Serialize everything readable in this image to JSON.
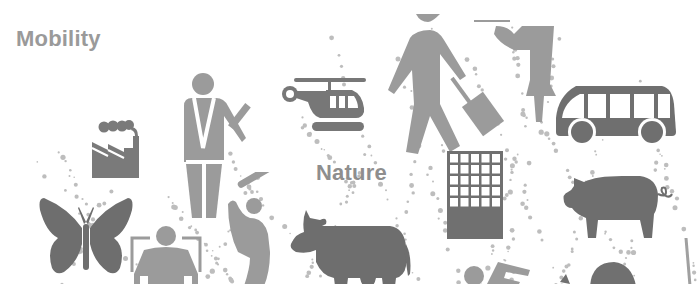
{
  "labels": {
    "mobility": "Mobility",
    "nature": "Nature"
  },
  "colors": {
    "background": "#ffffff",
    "light_gray": "#9b9b9b",
    "mid_gray": "#8a8a8a",
    "dark_gray": "#707070",
    "text_gray": "#9a9a9a"
  },
  "icons": [
    {
      "name": "factory-icon",
      "x": 92,
      "y": 118
    },
    {
      "name": "traffic-officer-icon",
      "x": 176,
      "y": 70
    },
    {
      "name": "helicopter-icon",
      "x": 280,
      "y": 78
    },
    {
      "name": "walking-traveler-icon",
      "x": 385,
      "y": 18
    },
    {
      "name": "rolling-suitcase-icon",
      "x": 455,
      "y": 80
    },
    {
      "name": "woman-hailing-icon",
      "x": 470,
      "y": 18
    },
    {
      "name": "bus-icon",
      "x": 556,
      "y": 85
    },
    {
      "name": "butterfly-icon",
      "x": 40,
      "y": 190
    },
    {
      "name": "wheelchair-person-icon",
      "x": 127,
      "y": 225
    },
    {
      "name": "baseball-batter-icon",
      "x": 225,
      "y": 175
    },
    {
      "name": "cow-icon",
      "x": 288,
      "y": 210
    },
    {
      "name": "building-icon",
      "x": 447,
      "y": 151
    },
    {
      "name": "pig-icon",
      "x": 565,
      "y": 175
    }
  ]
}
